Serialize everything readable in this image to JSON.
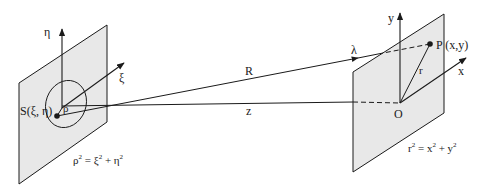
{
  "diagram": {
    "type": "diffraction-geometry",
    "colors": {
      "plane_fill": "#e8e8e8",
      "stroke": "#1a1a1a",
      "background": "#ffffff"
    },
    "source_plane": {
      "axis_vertical_label": "η",
      "axis_oblique_label": "ξ",
      "point_label": "S(ξ, η)",
      "radius_label": "ρ",
      "equation": {
        "lhs": "ρ",
        "lhs_exp": "2",
        "eq": " = ",
        "t1": "ξ",
        "t1_exp": "2",
        "plus": " + ",
        "t2": "η",
        "t2_exp": "2"
      }
    },
    "propagation": {
      "slant_distance_label": "R",
      "axial_distance_label": "z",
      "wavelength_label": "λ"
    },
    "observation_plane": {
      "axis_vertical_label": "y",
      "axis_oblique_label": "x",
      "origin_label": "O",
      "point_label": "P (x,y)",
      "radius_label": "r",
      "equation": {
        "lhs": "r",
        "lhs_exp": "2",
        "eq": " = ",
        "t1": "x",
        "t1_exp": "2",
        "plus": " + ",
        "t2": "y",
        "t2_exp": "2"
      }
    }
  }
}
